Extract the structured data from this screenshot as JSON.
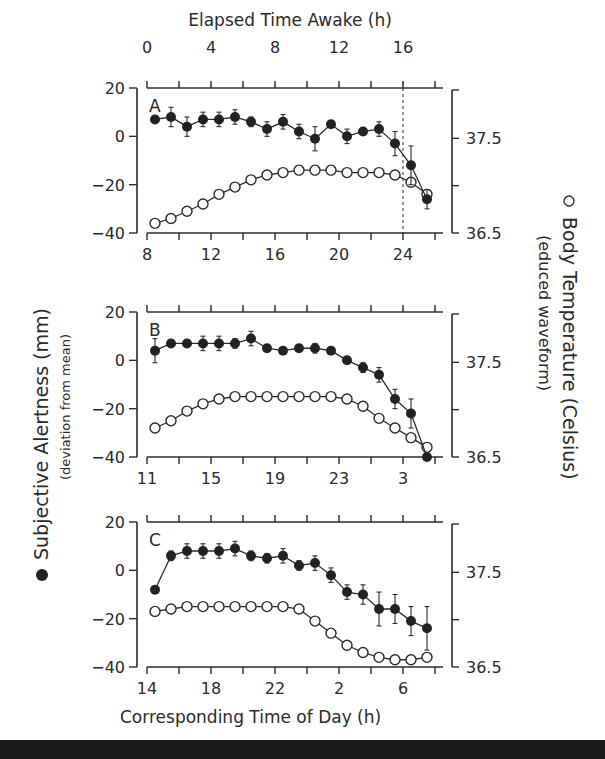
{
  "figure": {
    "top_axis_title": "Elapsed Time Awake (h)",
    "top_axis_ticks": [
      "0",
      "4",
      "8",
      "12",
      "16"
    ],
    "bottom_axis_title": "Corresponding Time of Day (h)",
    "left_axis_title": "Subjective Alertness (mm)",
    "left_axis_subtitle": "(deviation from mean)",
    "left_legend_marker": "●",
    "right_axis_title": "Body Temperature (Celsius)",
    "right_axis_subtitle": "(educed waveform)",
    "right_legend_marker": "○",
    "left_ticks": [
      "20",
      "0",
      "-20",
      "-40"
    ],
    "right_ticks": [
      "37.5",
      "36.5"
    ]
  },
  "chart_data": [
    {
      "type": "line",
      "panel": "A",
      "title": "A",
      "xlabel": "Corresponding Time of Day (h)",
      "x_ticks": [
        "8",
        "12",
        "16",
        "20",
        "24"
      ],
      "top_xlabel": "Elapsed Time Awake (h)",
      "top_ticks": [
        "0",
        "4",
        "8",
        "12",
        "16"
      ],
      "ylabel": "Subjective Alertness (mm) (deviation from mean)",
      "ylim": [
        -40,
        20
      ],
      "y2label": "Body Temperature (Celsius) (educed waveform)",
      "y2lim": [
        36.5,
        37.5
      ],
      "annotation": "dashed vertical line at 24 h (16 h awake)",
      "x": [
        8.5,
        9.5,
        10.5,
        11.5,
        12.5,
        13.5,
        14.5,
        15.5,
        16.5,
        17.5,
        18.5,
        19.5,
        20.5,
        21.5,
        22.5,
        23.5,
        24.5,
        25.5
      ],
      "series": [
        {
          "name": "Subjective Alertness",
          "marker": "filled",
          "values": [
            7,
            8,
            4,
            7,
            7,
            8,
            6,
            3,
            6,
            2,
            -1,
            5,
            0,
            2,
            3,
            -3,
            -12,
            -26
          ],
          "errors": [
            1,
            4,
            4,
            3,
            3,
            3,
            2,
            3,
            3,
            3,
            5,
            1,
            3,
            1,
            3,
            5,
            8,
            4
          ]
        },
        {
          "name": "Body Temperature",
          "marker": "open",
          "values": [
            -36,
            -34,
            -31,
            -28,
            -24,
            -21,
            -18,
            -16,
            -15,
            -14,
            -14,
            -14,
            -15,
            -15,
            -15,
            -16,
            -19,
            -24
          ]
        }
      ]
    },
    {
      "type": "line",
      "panel": "B",
      "title": "B",
      "xlabel": "Corresponding Time of Day (h)",
      "x_ticks": [
        "11",
        "15",
        "19",
        "23",
        "3"
      ],
      "ylim": [
        -40,
        20
      ],
      "y2lim": [
        36.5,
        37.5
      ],
      "x": [
        11.5,
        12.5,
        13.5,
        14.5,
        15.5,
        16.5,
        17.5,
        18.5,
        19.5,
        20.5,
        21.5,
        22.5,
        23.5,
        24.5,
        25.5,
        26.5,
        27.5,
        28.5
      ],
      "series": [
        {
          "name": "Subjective Alertness",
          "marker": "filled",
          "values": [
            4,
            7,
            7,
            7,
            7,
            7,
            9,
            5,
            4,
            5,
            5,
            4,
            0,
            -3,
            -6,
            -16,
            -22,
            -40
          ],
          "errors": [
            5,
            1,
            1,
            3,
            3,
            2,
            3,
            1,
            1,
            1,
            2,
            1,
            1,
            2,
            3,
            4,
            6,
            1
          ]
        },
        {
          "name": "Body Temperature",
          "marker": "open",
          "values": [
            -28,
            -25,
            -21,
            -18,
            -16,
            -15,
            -15,
            -15,
            -15,
            -15,
            -15,
            -15,
            -16,
            -19,
            -24,
            -28,
            -32,
            -36
          ]
        }
      ]
    },
    {
      "type": "line",
      "panel": "C",
      "title": "C",
      "xlabel": "Corresponding Time of Day (h)",
      "x_ticks": [
        "14",
        "18",
        "22",
        "2",
        "6"
      ],
      "ylim": [
        -40,
        20
      ],
      "y2lim": [
        36.5,
        37.5
      ],
      "x": [
        14.5,
        15.5,
        16.5,
        17.5,
        18.5,
        19.5,
        20.5,
        21.5,
        22.5,
        23.5,
        24.5,
        25.5,
        26.5,
        27.5,
        28.5,
        29.5,
        30.5,
        31.5,
        32.5
      ],
      "series": [
        {
          "name": "Subjective Alertness",
          "marker": "filled",
          "values": [
            -8,
            6,
            8,
            8,
            8,
            9,
            6,
            5,
            6,
            2,
            3,
            -2,
            -9,
            -10,
            -16,
            -16,
            -21,
            -24
          ],
          "errors": [
            1,
            2,
            3,
            3,
            3,
            3,
            2,
            2,
            3,
            2,
            3,
            3,
            3,
            4,
            7,
            6,
            6,
            9
          ]
        },
        {
          "name": "Body Temperature",
          "marker": "open",
          "values": [
            -17,
            -16,
            -15,
            -15,
            -15,
            -15,
            -15,
            -15,
            -15,
            -16,
            -21,
            -26,
            -31,
            -34,
            -36,
            -37,
            -37,
            -36
          ]
        }
      ]
    }
  ]
}
